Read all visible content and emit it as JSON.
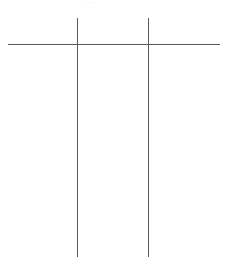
{
  "canvas": {
    "width": 227,
    "height": 261,
    "background_color": "#ffffff"
  },
  "diagram": {
    "name": "table-rule-skeleton",
    "line_color": "#5a5a5a",
    "line_width": 1,
    "horizontal_rules": [
      {
        "id": "header-rule",
        "label": "horizontal-rule",
        "x_start": 8,
        "x_end": 220,
        "y": 44,
        "thickness": 1,
        "color": "#5a5a5a"
      }
    ],
    "vertical_rules": [
      {
        "id": "column-divider-1",
        "label": "vertical-rule-left",
        "x": 77,
        "y_start": 18,
        "y_end": 257,
        "thickness": 1,
        "color": "#5a5a5a"
      },
      {
        "id": "column-divider-2",
        "label": "vertical-rule-right",
        "x": 148,
        "y_start": 18,
        "y_end": 257,
        "thickness": 1,
        "color": "#5a5a5a"
      }
    ],
    "intersections": [
      {
        "id": "intersection-left",
        "x": 77,
        "y": 44
      },
      {
        "id": "intersection-right",
        "x": 148,
        "y": 44
      }
    ],
    "column_regions": [
      {
        "id": "column-1",
        "x_start": 8,
        "x_end": 77
      },
      {
        "id": "column-2",
        "x_start": 77,
        "x_end": 148
      },
      {
        "id": "column-3",
        "x_start": 148,
        "x_end": 220
      }
    ],
    "clipped_fragment": {
      "id": "top-clipped-text",
      "text": "——",
      "x": 84,
      "y": 0,
      "color": "#efefef"
    }
  }
}
